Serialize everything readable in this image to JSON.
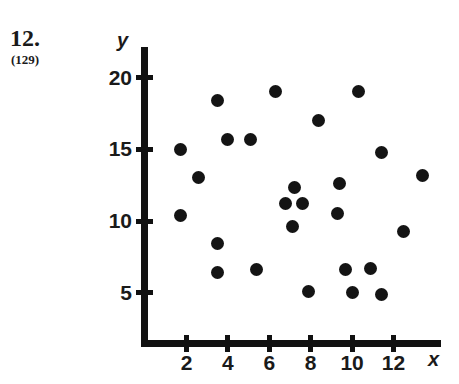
{
  "problem": {
    "number": "12.",
    "reference": "(129)"
  },
  "chart_data": {
    "type": "scatter",
    "title": "",
    "xlabel": "x",
    "ylabel": "y",
    "xlim": [
      0,
      14
    ],
    "ylim": [
      0,
      21.5
    ],
    "grid": false,
    "legend": null,
    "x_ticks": [
      2,
      4,
      6,
      8,
      10,
      12
    ],
    "x_tick_labels": [
      "2",
      "4",
      "6",
      "8",
      "10",
      "12"
    ],
    "y_ticks": [
      5,
      10,
      15,
      20
    ],
    "y_tick_labels": [
      "5",
      "10",
      "15",
      "20"
    ],
    "point_count": 26,
    "points": [
      {
        "x": 1.7,
        "y": 15.0
      },
      {
        "x": 3.5,
        "y": 18.4
      },
      {
        "x": 6.3,
        "y": 19.0
      },
      {
        "x": 10.3,
        "y": 19.0
      },
      {
        "x": 2.6,
        "y": 13.0
      },
      {
        "x": 4.0,
        "y": 15.7
      },
      {
        "x": 5.1,
        "y": 15.7
      },
      {
        "x": 8.4,
        "y": 17.0
      },
      {
        "x": 11.4,
        "y": 14.8
      },
      {
        "x": 1.7,
        "y": 10.4
      },
      {
        "x": 13.4,
        "y": 13.2
      },
      {
        "x": 9.4,
        "y": 12.6
      },
      {
        "x": 7.2,
        "y": 12.3
      },
      {
        "x": 6.8,
        "y": 11.2
      },
      {
        "x": 7.6,
        "y": 11.2
      },
      {
        "x": 9.3,
        "y": 10.5
      },
      {
        "x": 7.1,
        "y": 9.6
      },
      {
        "x": 3.5,
        "y": 8.4
      },
      {
        "x": 12.5,
        "y": 9.3
      },
      {
        "x": 3.5,
        "y": 6.4
      },
      {
        "x": 5.4,
        "y": 6.6
      },
      {
        "x": 7.9,
        "y": 5.1
      },
      {
        "x": 9.7,
        "y": 6.6
      },
      {
        "x": 10.9,
        "y": 6.7
      },
      {
        "x": 10.0,
        "y": 5.0
      },
      {
        "x": 11.4,
        "y": 4.9
      }
    ]
  }
}
